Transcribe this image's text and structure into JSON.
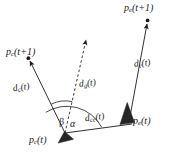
{
  "figure": {
    "background_color": "#ffffff",
    "stroke_color": "#1a1a1a"
  },
  "points": {
    "pc_next": {
      "label_main": "p",
      "label_sub": "c",
      "label_arg": "(t+1)",
      "x": 28,
      "y": 58
    },
    "pe_next": {
      "label_main": "p",
      "label_sub": "e",
      "label_arg": "(t+1)",
      "x": 148,
      "y": 20
    },
    "pc_now": {
      "label_main": "p",
      "label_sub": "c",
      "label_arg": "(t)",
      "x": 65,
      "y": 133
    },
    "pe_now": {
      "label_main": "p",
      "label_sub": "e",
      "label_arg": "(t)",
      "x": 129,
      "y": 122
    }
  },
  "vectors": [
    {
      "name": "dc",
      "label_main": "d",
      "label_sub": "c",
      "label_arg": "(t)",
      "style": "solid",
      "from": "pc_now",
      "to": "pc_next"
    },
    {
      "name": "de",
      "label_main": "d",
      "label_sub": "e",
      "label_arg": "(t)",
      "style": "solid",
      "from": "pe_now",
      "to": "pe_next"
    },
    {
      "name": "dg",
      "label_main": "d",
      "label_sub": "g",
      "label_arg": "(t)",
      "style": "dashed",
      "from": "pc_now",
      "to": "goal"
    },
    {
      "name": "dce",
      "label_main": "d",
      "label_sub": "ce",
      "label_arg": "(t)",
      "style": "solid",
      "from": "pc_now",
      "to": "pe_now"
    }
  ],
  "angles": [
    {
      "name": "beta",
      "symbol": "β",
      "between": [
        "dc",
        "dg"
      ]
    },
    {
      "name": "alpha",
      "symbol": "α",
      "between": [
        "dg",
        "dce"
      ]
    }
  ],
  "markers": {
    "agent_c": "triangle-marker",
    "agent_e": "triangle-marker",
    "endpoint_c": "dot-marker",
    "endpoint_e": "dot-marker",
    "goal_tip": "arrowhead"
  }
}
